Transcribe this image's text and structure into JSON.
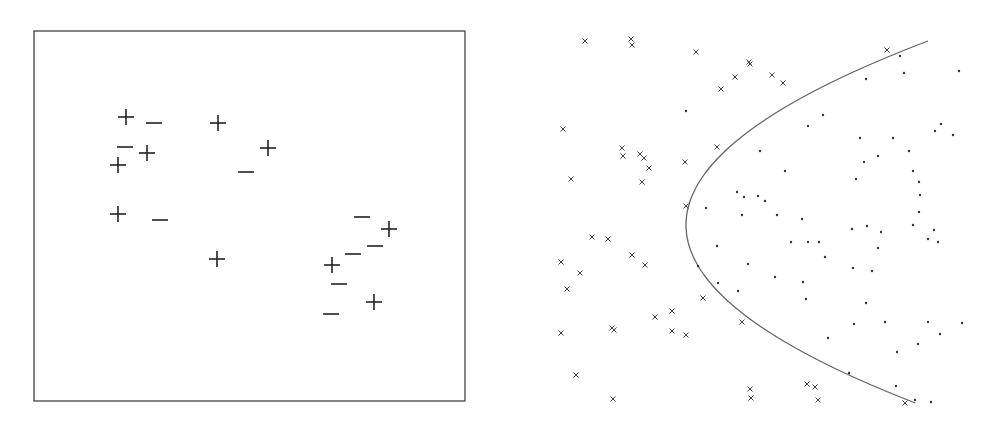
{
  "left_panel": {
    "description": "Scatter of labeled training points (+ and -) inside a bordered frame",
    "frame": {
      "x1": 34,
      "y1": 31,
      "x2": 465,
      "y2": 401
    },
    "plus_points": [
      [
        126,
        117
      ],
      [
        218,
        123
      ],
      [
        147,
        153
      ],
      [
        268,
        148
      ],
      [
        118,
        165
      ],
      [
        118,
        214
      ],
      [
        217,
        259
      ],
      [
        389,
        229
      ],
      [
        332,
        265
      ],
      [
        374,
        302
      ]
    ],
    "minus_points": [
      [
        154,
        123
      ],
      [
        125,
        147
      ],
      [
        246,
        172
      ],
      [
        160,
        220
      ],
      [
        362,
        217
      ],
      [
        375,
        246
      ],
      [
        353,
        254
      ],
      [
        339,
        284
      ],
      [
        331,
        314
      ]
    ],
    "marker_color": "#222222"
  },
  "right_panel": {
    "description": "Scatter of x-marked and dot points separated by a parabolic decision boundary",
    "boundary_color": "#666666",
    "x_points": [
      [
        585,
        41
      ],
      [
        631,
        39
      ],
      [
        632,
        45
      ],
      [
        696,
        52
      ],
      [
        749,
        62
      ],
      [
        750,
        64
      ],
      [
        735,
        77
      ],
      [
        772,
        75
      ],
      [
        783,
        83
      ],
      [
        721,
        89
      ],
      [
        887,
        50
      ],
      [
        563,
        129
      ],
      [
        622,
        148
      ],
      [
        623,
        156
      ],
      [
        640,
        154
      ],
      [
        644,
        158
      ],
      [
        649,
        168
      ],
      [
        685,
        162
      ],
      [
        717,
        147
      ],
      [
        571,
        179
      ],
      [
        642,
        182
      ],
      [
        686,
        206
      ],
      [
        592,
        237
      ],
      [
        608,
        239
      ],
      [
        561,
        262
      ],
      [
        632,
        255
      ],
      [
        645,
        265
      ],
      [
        580,
        273
      ],
      [
        567,
        289
      ],
      [
        703,
        298
      ],
      [
        655,
        317
      ],
      [
        672,
        311
      ],
      [
        742,
        322
      ],
      [
        561,
        333
      ],
      [
        612,
        328
      ],
      [
        614,
        330
      ],
      [
        672,
        331
      ],
      [
        686,
        335
      ],
      [
        576,
        375
      ],
      [
        613,
        399
      ],
      [
        750,
        389
      ],
      [
        751,
        398
      ],
      [
        807,
        384
      ],
      [
        815,
        387
      ],
      [
        818,
        400
      ],
      [
        905,
        403
      ]
    ],
    "dot_points": [
      [
        686,
        111
      ],
      [
        900,
        56
      ],
      [
        904,
        73
      ],
      [
        959,
        71
      ],
      [
        866,
        79
      ],
      [
        808,
        126
      ],
      [
        823,
        115
      ],
      [
        760,
        151
      ],
      [
        860,
        138
      ],
      [
        878,
        156
      ],
      [
        893,
        138
      ],
      [
        935,
        131
      ],
      [
        941,
        124
      ],
      [
        953,
        135
      ],
      [
        785,
        171
      ],
      [
        758,
        196
      ],
      [
        765,
        201
      ],
      [
        744,
        197
      ],
      [
        802,
        219
      ],
      [
        808,
        242
      ],
      [
        825,
        257
      ],
      [
        928,
        239
      ],
      [
        934,
        230
      ],
      [
        938,
        242
      ],
      [
        881,
        232
      ],
      [
        913,
        171
      ],
      [
        919,
        182
      ],
      [
        920,
        195
      ],
      [
        919,
        212
      ],
      [
        913,
        225
      ],
      [
        775,
        277
      ],
      [
        806,
        299
      ],
      [
        791,
        242
      ],
      [
        819,
        242
      ],
      [
        853,
        268
      ],
      [
        872,
        271
      ],
      [
        878,
        248
      ],
      [
        706,
        208
      ],
      [
        717,
        246
      ],
      [
        718,
        283
      ],
      [
        738,
        291
      ],
      [
        748,
        264
      ],
      [
        803,
        282
      ],
      [
        852,
        229
      ],
      [
        867,
        226
      ],
      [
        909,
        151
      ],
      [
        856,
        179
      ],
      [
        864,
        162
      ],
      [
        777,
        215
      ],
      [
        742,
        215
      ],
      [
        737,
        192
      ],
      [
        698,
        266
      ],
      [
        866,
        303
      ],
      [
        928,
        322
      ],
      [
        940,
        334
      ],
      [
        962,
        323
      ],
      [
        918,
        344
      ],
      [
        849,
        373
      ],
      [
        896,
        386
      ],
      [
        915,
        400
      ],
      [
        931,
        402
      ],
      [
        897,
        352
      ],
      [
        854,
        324
      ],
      [
        828,
        338
      ],
      [
        885,
        322
      ]
    ],
    "boundary_curve": {
      "type": "parabola",
      "vertex": [
        686,
        225
      ],
      "top_end": [
        928,
        41
      ],
      "bottom_end": [
        918,
        404
      ]
    }
  }
}
